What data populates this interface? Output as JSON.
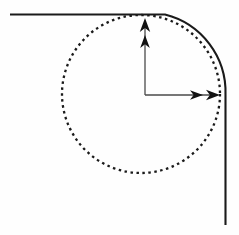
{
  "figure": {
    "title": "Rounded corner with inscribed dashed circle and coordinate axes",
    "canvas": {
      "width": 239,
      "height": 235,
      "background_color": "#fefefe"
    },
    "stroke_color": "#1a1a1a",
    "elements": {
      "top_line_label": "horizontal solid boundary line",
      "corner_arc_label": "quarter-circle rounded corner",
      "right_line_label": "vertical solid boundary line",
      "dashed_circle_label": "inscribed dashed circle",
      "y_axis_label": "vertical axis arrow",
      "x_axis_label": "horizontal axis arrow"
    }
  },
  "chart_data": {
    "type": "scatter",
    "title": "Rounded corner with inscribed dashed circle and coordinate axes",
    "xlabel": "",
    "ylabel": "",
    "xlim": [
      0,
      239
    ],
    "ylim": [
      235,
      0
    ],
    "grid": false,
    "legend": "none",
    "annotations": [],
    "shapes": [
      {
        "name": "top-boundary-line",
        "kind": "line",
        "style": "solid",
        "stroke": "#1a1a1a",
        "stroke_width": 2.1,
        "x1": 10,
        "y1": 14.5,
        "x2": 165,
        "y2": 14.5
      },
      {
        "name": "corner-arc",
        "kind": "arc",
        "style": "solid",
        "stroke": "#1a1a1a",
        "stroke_width": 2.1,
        "center_x": 165,
        "center_y": 94.5,
        "radius": 80,
        "start_angle_deg": 270,
        "end_angle_deg": 360,
        "start_x": 165,
        "start_y": 14.5,
        "end_x": 225.5,
        "end_y": 94.5
      },
      {
        "name": "right-boundary-line",
        "kind": "line",
        "style": "solid",
        "stroke": "#1a1a1a",
        "stroke_width": 2.1,
        "x1": 225.5,
        "y1": 94.5,
        "x2": 225.5,
        "y2": 225
      },
      {
        "name": "inscribed-dashed-circle",
        "kind": "circle",
        "style": "dashed",
        "stroke": "#1a1a1a",
        "stroke_width": 2.3,
        "dash_pattern": "2.5 3.5",
        "fill": "none",
        "center_x": 141,
        "center_y": 94,
        "radius": 79
      },
      {
        "name": "y-axis-arrow",
        "kind": "arrow",
        "style": "solid",
        "stroke": "#4a4a4a",
        "stroke_width": 1.3,
        "x1": 145,
        "y1": 95,
        "x2": 145,
        "y2": 22,
        "tip_x": 145,
        "tip_y": 18,
        "arrowheads": 2,
        "direction": "up"
      },
      {
        "name": "x-axis-arrow",
        "kind": "arrow",
        "style": "solid",
        "stroke": "#4a4a4a",
        "stroke_width": 1.3,
        "x1": 145,
        "y1": 95,
        "x2": 214,
        "y2": 95,
        "tip_x": 220,
        "tip_y": 95,
        "arrowheads": 2,
        "direction": "right"
      }
    ],
    "points": [
      {
        "name": "origin",
        "x": 145,
        "y": 95
      },
      {
        "name": "circle-center",
        "x": 141,
        "y": 94
      },
      {
        "name": "arc-center",
        "x": 165,
        "y": 94.5
      },
      {
        "name": "circle-top-tangent",
        "x": 141,
        "y": 15
      },
      {
        "name": "circle-bottom",
        "x": 141,
        "y": 173
      },
      {
        "name": "circle-left",
        "x": 62,
        "y": 94
      },
      {
        "name": "circle-right-tangent",
        "x": 220,
        "y": 94
      }
    ]
  }
}
